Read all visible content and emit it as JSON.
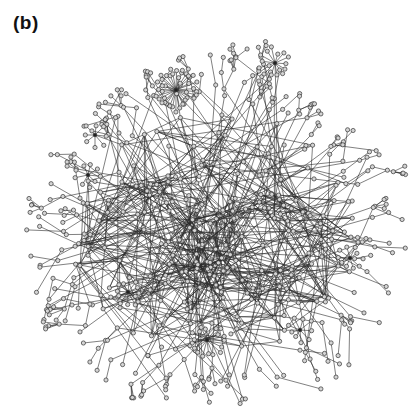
{
  "figure": {
    "panel_label": "(b)",
    "type": "network-graph",
    "colors": {
      "background": "#ffffff",
      "edge": "#2a2a2a",
      "node_fill": "#d4d4d4",
      "node_stroke": "#333333"
    },
    "layout": {
      "center": [
        215,
        235
      ],
      "core_radius": 70,
      "outer_radius": 185
    },
    "hubs": [
      {
        "name": "hub-top-star",
        "x": 176,
        "y": 90,
        "spokes": 34,
        "r": 22
      },
      {
        "name": "hub-upper-right",
        "x": 275,
        "y": 63,
        "spokes": 14,
        "r": 16
      },
      {
        "name": "hub-bottom-center",
        "x": 207,
        "y": 340,
        "spokes": 18,
        "r": 18
      },
      {
        "name": "hub-bottom-left",
        "x": 128,
        "y": 292,
        "spokes": 12,
        "r": 15
      },
      {
        "name": "hub-right",
        "x": 350,
        "y": 258,
        "spokes": 10,
        "r": 14
      },
      {
        "name": "hub-left",
        "x": 88,
        "y": 175,
        "spokes": 9,
        "r": 14
      },
      {
        "name": "hub-upper-left",
        "x": 95,
        "y": 135,
        "spokes": 8,
        "r": 13
      },
      {
        "name": "hub-lower-right",
        "x": 300,
        "y": 330,
        "spokes": 9,
        "r": 14
      }
    ],
    "generation": {
      "seed": 1337,
      "core_nodes": 260,
      "periphery_branches": 140,
      "core_edges": 620
    }
  }
}
